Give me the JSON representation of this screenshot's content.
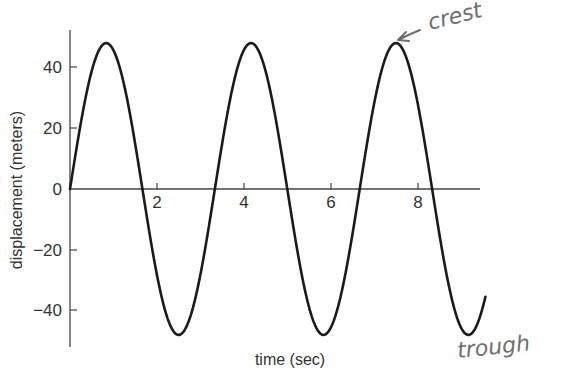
{
  "chart_data": {
    "type": "line",
    "title": "",
    "xlabel": "time (sec)",
    "ylabel": "displacement (meters)",
    "xlim": [
      0,
      9.55
    ],
    "ylim": [
      -52,
      52
    ],
    "x_ticks": [
      2,
      4,
      6,
      8
    ],
    "x_tick_labels": [
      "2",
      "4",
      "6",
      "8"
    ],
    "y_ticks": [
      40,
      20,
      0,
      -20,
      -40
    ],
    "y_tick_labels": [
      "40",
      "20",
      "0",
      "−20",
      "−40"
    ],
    "grid": false,
    "legend": null,
    "series": [
      {
        "name": "displacement",
        "function": "48 * sin(2*pi*t/3.33)",
        "amplitude": 48,
        "period": 3.33,
        "t_start": 0,
        "t_end": 9.55,
        "color": "#1a1a1a",
        "x": [
          0,
          0.83,
          1.665,
          2.5,
          3.33,
          4.16,
          5.0,
          5.83,
          6.66,
          7.49,
          8.33,
          9.16,
          9.55
        ],
        "y": [
          0,
          48,
          0,
          -48,
          0,
          48,
          0,
          -48,
          0,
          48,
          0,
          -48,
          -36
        ]
      }
    ],
    "annotations": [
      {
        "text": "crest",
        "handwritten": true,
        "points_to": {
          "x": 7.49,
          "y": 48
        }
      },
      {
        "text": "trough",
        "handwritten": true,
        "points_to": {
          "x": 9.16,
          "y": -48
        }
      }
    ]
  },
  "labels": {
    "xlabel": "time (sec)",
    "ylabel": "displacement (meters)",
    "crest": "crest",
    "trough": "trough",
    "xt0": "2",
    "xt1": "4",
    "xt2": "6",
    "xt3": "8",
    "yt0": "40",
    "yt1": "20",
    "yt2": "0",
    "yt3": "−20",
    "yt4": "−40"
  }
}
